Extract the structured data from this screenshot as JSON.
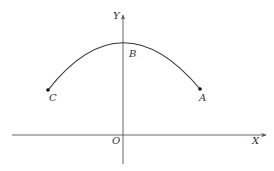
{
  "diagram": {
    "type": "coordinate-plane-arc",
    "colors": {
      "background": "#ffffff",
      "axis": "#555555",
      "curve": "#333333",
      "point": "#111111",
      "text": "#333333"
    },
    "axes": {
      "x_label": "X",
      "y_label": "Y",
      "origin_label": "O"
    },
    "points": [
      {
        "id": "A",
        "label": "A"
      },
      {
        "id": "B",
        "label": "B"
      },
      {
        "id": "C",
        "label": "C"
      }
    ],
    "curve": {
      "description": "downward arc from C through B (on Y axis) to A"
    }
  }
}
